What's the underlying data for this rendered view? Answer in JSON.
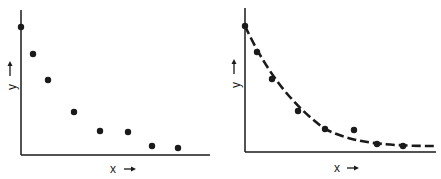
{
  "chart_data": [
    {
      "type": "scatter",
      "title": "",
      "xlabel": "x",
      "ylabel": "y",
      "xlabel_arrow": "→",
      "ylabel_arrow": "→",
      "grid": false,
      "ticks": false,
      "x": [
        0,
        1,
        2.3,
        4.5,
        6.7,
        9.1,
        11.1,
        13.3
      ],
      "y": [
        100,
        79,
        58,
        33,
        18,
        18,
        7,
        5
      ],
      "xlim": [
        0,
        16
      ],
      "ylim": [
        0,
        115
      ]
    },
    {
      "type": "scatter",
      "title": "",
      "xlabel": "x",
      "ylabel": "y",
      "xlabel_arrow": "→",
      "ylabel_arrow": "→",
      "grid": false,
      "ticks": false,
      "x": [
        0,
        1,
        2.3,
        4.5,
        6.7,
        9.1,
        11.1,
        13.3
      ],
      "y": [
        100,
        79,
        58,
        33,
        18,
        18,
        7,
        5
      ],
      "xlim": [
        0,
        16
      ],
      "ylim": [
        0,
        115
      ],
      "fit_curve": {
        "style": "dashed",
        "form": "exponential decay",
        "asymptote_y": 5
      }
    }
  ],
  "left": {
    "xlabel": "x",
    "ylabel": "y",
    "axis": {
      "x0": 21,
      "y0": 155,
      "x1": 210,
      "ytop": 10
    },
    "points_px": [
      [
        21,
        27
      ],
      [
        33,
        54
      ],
      [
        48,
        80
      ],
      [
        74,
        112
      ],
      [
        100,
        131
      ],
      [
        128,
        132
      ],
      [
        152,
        146
      ],
      [
        178,
        148
      ]
    ]
  },
  "right": {
    "xlabel": "x",
    "ylabel": "y",
    "axis": {
      "x0": 245,
      "y0": 152,
      "x1": 436,
      "ytop": 8
    },
    "points_px": [
      [
        245,
        26
      ],
      [
        257,
        52
      ],
      [
        272,
        79
      ],
      [
        298,
        111
      ],
      [
        325,
        129
      ],
      [
        354,
        130
      ],
      [
        377,
        144
      ],
      [
        403,
        146
      ]
    ],
    "curve_px": "M245,26 C262,62 285,100 325,129 C350,141 375,146 436,146"
  }
}
